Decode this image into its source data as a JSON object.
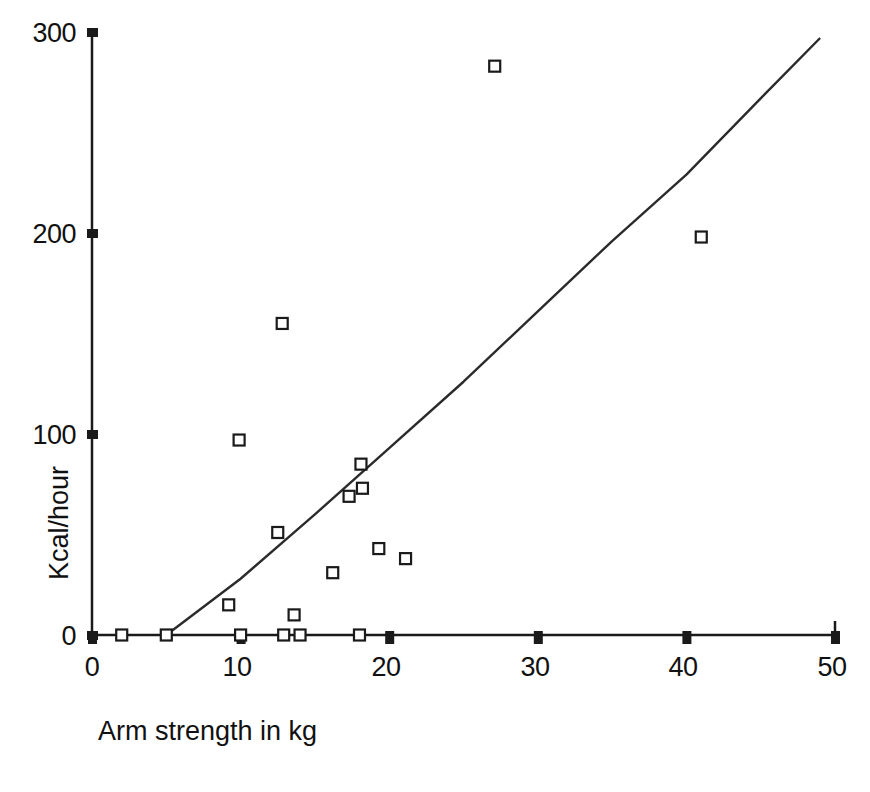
{
  "chart_data": {
    "type": "scatter",
    "title": "",
    "xlabel": "Arm strength in kg",
    "ylabel": "Kcal/hour",
    "xlim": [
      0,
      50
    ],
    "ylim": [
      0,
      300
    ],
    "xticks": [
      0,
      10,
      20,
      30,
      40,
      50
    ],
    "yticks": [
      0,
      100,
      200,
      300
    ],
    "xtick_labels": [
      "0",
      "10",
      "20",
      "30",
      "40",
      "50"
    ],
    "ytick_labels": [
      "0",
      "100",
      "200",
      "300"
    ],
    "grid": false,
    "legend": null,
    "marker": "open-square",
    "series": [
      {
        "name": "observations",
        "x": [
          2.0,
          5.0,
          9.2,
          9.9,
          10.0,
          12.5,
          12.8,
          12.9,
          13.6,
          14.0,
          16.2,
          17.3,
          18.0,
          18.1,
          18.2,
          19.3,
          21.1,
          27.1,
          41.0
        ],
        "y": [
          0,
          0,
          15,
          97,
          0,
          51,
          155,
          0,
          10,
          0,
          31,
          69,
          0,
          85,
          73,
          43,
          38,
          283,
          198
        ]
      }
    ],
    "fit_line": {
      "name": "regression line",
      "x": [
        5.0,
        10.0,
        15.0,
        20.0,
        25.0,
        30.0,
        35.0,
        40.0,
        45.0,
        49.0
      ],
      "y": [
        0,
        28,
        60,
        93,
        126,
        161,
        196,
        229,
        267,
        297
      ]
    }
  },
  "axes": {
    "y_title": "Kcal/hour",
    "x_title": "Arm strength in kg"
  },
  "colors": {
    "axis": "#1a1a1a",
    "marker": "#1a1a1a",
    "line": "#2b2b2b",
    "background": "#ffffff"
  }
}
